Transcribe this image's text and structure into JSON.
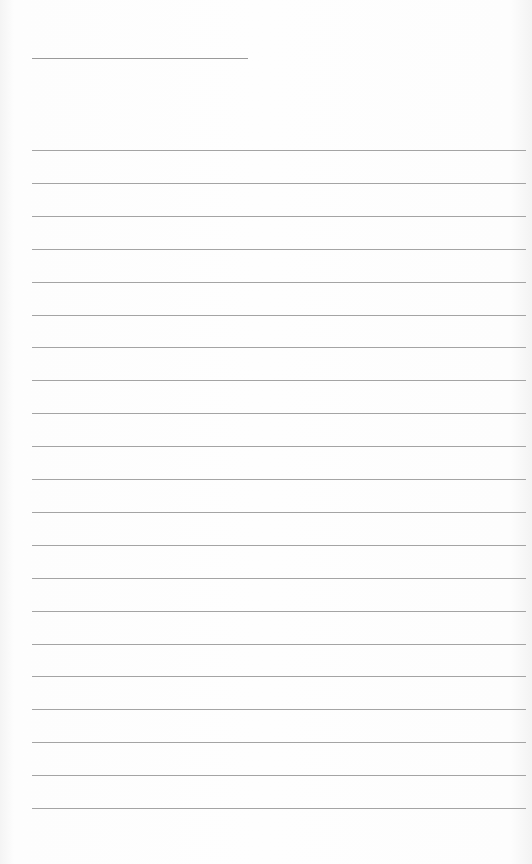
{
  "document": {
    "type": "lined-paper",
    "background_color": "#fdfdfd",
    "line_color": "#a4a4a4",
    "title_line": {
      "x": 32,
      "y": 58,
      "width": 216
    },
    "rules": {
      "count": 21,
      "first_y": 150,
      "last_y": 808,
      "x": 32,
      "width": 494
    }
  }
}
